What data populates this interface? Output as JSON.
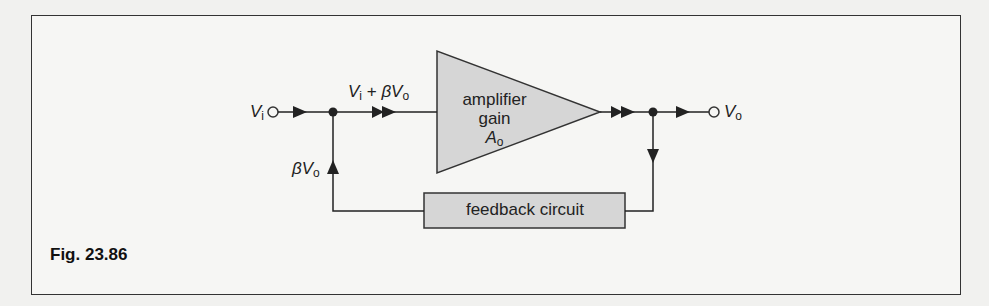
{
  "figure": {
    "caption": "Fig. 23.86"
  },
  "labels": {
    "input": {
      "symbol": "V",
      "sub": "i"
    },
    "sum": {
      "a_symbol": "V",
      "a_sub": "i",
      "op": " + ",
      "beta": "β",
      "b_symbol": "V",
      "b_sub": "o"
    },
    "feedback_signal": {
      "beta": "β",
      "symbol": "V",
      "sub": "o"
    },
    "output": {
      "symbol": "V",
      "sub": "o"
    }
  },
  "blocks": {
    "amplifier": {
      "line1": "amplifier",
      "line2": "gain",
      "gain_symbol": "A",
      "gain_sub": "o"
    },
    "feedback": {
      "label": "feedback circuit"
    }
  },
  "colors": {
    "line": "#222222",
    "block_fill": "#d6d6d6",
    "background": "#f6f6f4"
  }
}
